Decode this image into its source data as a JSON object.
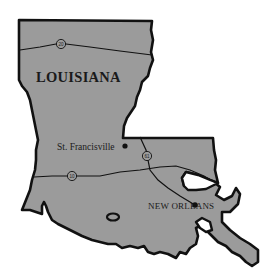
{
  "map": {
    "title": "LOUISIANA",
    "colors": {
      "state_fill": "#9b9b9b",
      "outline": "#111111",
      "background": "#ffffff",
      "text": "#1a1a1a"
    },
    "highways": [
      {
        "id": "I-20",
        "shield_label": "20"
      },
      {
        "id": "US-61",
        "shield_label": "61"
      },
      {
        "id": "I-10",
        "shield_label": "10"
      }
    ],
    "cities": [
      {
        "name": "St. Francisville"
      },
      {
        "name": "NEW ORLEANS"
      }
    ]
  }
}
